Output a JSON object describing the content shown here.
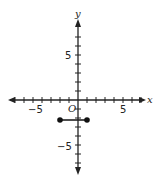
{
  "chart_data": {
    "type": "line",
    "title": "",
    "xlabel": "x",
    "ylabel": "y",
    "origin_label": "O",
    "xlim": [
      -7,
      7
    ],
    "ylim": [
      -7,
      7
    ],
    "x_tick_labels": [
      "-5",
      "5"
    ],
    "y_tick_labels": [
      "5",
      "-5"
    ],
    "grid": false,
    "series": [
      {
        "name": "segment",
        "points": [
          {
            "x": -2,
            "y": -2
          },
          {
            "x": 1,
            "y": -2
          }
        ],
        "endpoints": "closed"
      }
    ]
  },
  "labels": {
    "x_axis": "x",
    "y_axis": "y",
    "origin": "O",
    "x_neg5": "−5",
    "x_pos5": "5",
    "y_pos5": "5",
    "y_neg5": "−5"
  }
}
